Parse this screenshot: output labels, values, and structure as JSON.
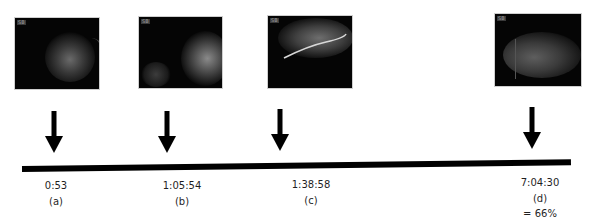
{
  "figure": {
    "background": "#ffffff",
    "accent_color": "#000000",
    "events": [
      {
        "id": "a",
        "time": "0:53",
        "label": "(a)",
        "note": "",
        "thumbnail": {
          "tag": "SB",
          "description": "dark endoscopic frame, faint mucosal folds"
        }
      },
      {
        "id": "b",
        "time": "1:05:54",
        "label": "(b)",
        "note": "",
        "thumbnail": {
          "tag": "SB",
          "description": "dark endoscopic frame, bright tissue on right"
        }
      },
      {
        "id": "c",
        "time": "1:38:58",
        "label": "(c)",
        "note": "",
        "thumbnail": {
          "tag": "SB",
          "description": "endoscopic frame with bright curved fold"
        }
      },
      {
        "id": "d",
        "time": "7:04:30",
        "label": "(d)",
        "note": "= 66%",
        "thumbnail": {
          "tag": "SB",
          "description": "grainy frame with diffuse grey tissue"
        }
      }
    ]
  }
}
